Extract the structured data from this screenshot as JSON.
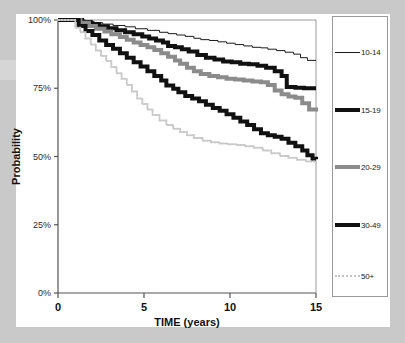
{
  "figure": {
    "background_color": "#c9c9c9",
    "panel_color": "#ffffff"
  },
  "chart_data": {
    "type": "line",
    "title": "",
    "subtitle": "",
    "xlabel": "TIME (years)",
    "ylabel": "Probability",
    "xlim": [
      0,
      15
    ],
    "ylim": [
      0,
      1
    ],
    "xticks": [
      "0",
      "5",
      "10",
      "15"
    ],
    "xtick_values": [
      0,
      5,
      10,
      15
    ],
    "yticks": [
      "0%",
      "25%",
      "50%",
      "75%",
      "100%"
    ],
    "ytick_values": [
      0,
      0.25,
      0.5,
      0.75,
      1.0
    ],
    "grid": false,
    "legend_position": "right",
    "curve_style": "step",
    "series": [
      {
        "name": "10-14",
        "color": "#1a1a1a",
        "width": 1,
        "dash": "none",
        "x": [
          0,
          0.9,
          1.6,
          2.1,
          2.6,
          3.2,
          3.9,
          4.5,
          5.2,
          5.9,
          6.4,
          6.9,
          7.4,
          7.9,
          8.3,
          8.8,
          9.3,
          9.8,
          10.3,
          10.8,
          11.3,
          11.8,
          12.2,
          12.7,
          13.2,
          13.7,
          14.1,
          14.5,
          15
        ],
        "y": [
          1.0,
          1.0,
          0.995,
          0.99,
          0.985,
          0.98,
          0.975,
          0.968,
          0.962,
          0.955,
          0.95,
          0.945,
          0.94,
          0.933,
          0.928,
          0.925,
          0.92,
          0.915,
          0.91,
          0.905,
          0.9,
          0.898,
          0.893,
          0.888,
          0.882,
          0.875,
          0.862,
          0.852,
          0.852
        ]
      },
      {
        "name": "15-19",
        "color": "#111111",
        "width": 4,
        "dash": "none",
        "x": [
          0,
          0.9,
          1.4,
          1.9,
          2.4,
          2.9,
          3.4,
          3.9,
          4.4,
          4.9,
          5.3,
          5.7,
          6.1,
          6.4,
          6.8,
          7.2,
          7.6,
          8.1,
          8.6,
          9.1,
          9.6,
          10.1,
          10.6,
          11.1,
          11.6,
          12.1,
          12.6,
          13.0,
          13.3,
          13.8,
          14.3,
          15
        ],
        "y": [
          1.0,
          1.0,
          0.993,
          0.985,
          0.977,
          0.97,
          0.962,
          0.955,
          0.948,
          0.94,
          0.932,
          0.925,
          0.918,
          0.905,
          0.9,
          0.893,
          0.885,
          0.872,
          0.862,
          0.855,
          0.848,
          0.845,
          0.84,
          0.838,
          0.832,
          0.825,
          0.812,
          0.795,
          0.755,
          0.752,
          0.75,
          0.75
        ]
      },
      {
        "name": "20-29",
        "color": "#8b8b8b",
        "width": 4,
        "dash": "none",
        "x": [
          0,
          0.9,
          1.3,
          1.8,
          2.2,
          2.7,
          3.1,
          3.6,
          4.0,
          4.4,
          4.8,
          5.2,
          5.6,
          6.0,
          6.4,
          6.8,
          7.1,
          7.5,
          7.9,
          8.3,
          8.8,
          9.3,
          9.8,
          10.3,
          10.8,
          11.3,
          11.8,
          12.2,
          12.6,
          13.0,
          13.4,
          13.8,
          14.2,
          14.6,
          15
        ],
        "y": [
          1.0,
          1.0,
          0.99,
          0.978,
          0.968,
          0.958,
          0.948,
          0.938,
          0.928,
          0.918,
          0.908,
          0.9,
          0.89,
          0.878,
          0.865,
          0.852,
          0.84,
          0.825,
          0.812,
          0.802,
          0.795,
          0.79,
          0.785,
          0.782,
          0.778,
          0.775,
          0.772,
          0.762,
          0.742,
          0.728,
          0.72,
          0.715,
          0.695,
          0.672,
          0.665
        ]
      },
      {
        "name": "30-49",
        "color": "#111111",
        "width": 4,
        "dash": "none",
        "x": [
          0,
          0.8,
          1.2,
          1.6,
          2.0,
          2.4,
          2.8,
          3.2,
          3.6,
          4.0,
          4.4,
          4.8,
          5.2,
          5.6,
          6.0,
          6.3,
          6.7,
          7.0,
          7.4,
          7.8,
          8.2,
          8.6,
          9.0,
          9.4,
          9.8,
          10.2,
          10.6,
          11.0,
          11.4,
          11.8,
          12.2,
          12.6,
          13.0,
          13.4,
          13.8,
          14.2,
          14.5,
          14.8,
          15
        ],
        "y": [
          1.0,
          1.0,
          0.978,
          0.96,
          0.945,
          0.925,
          0.908,
          0.895,
          0.878,
          0.862,
          0.845,
          0.83,
          0.812,
          0.795,
          0.778,
          0.76,
          0.748,
          0.735,
          0.722,
          0.712,
          0.702,
          0.69,
          0.678,
          0.668,
          0.655,
          0.642,
          0.628,
          0.615,
          0.6,
          0.585,
          0.578,
          0.572,
          0.565,
          0.55,
          0.538,
          0.522,
          0.505,
          0.492,
          0.49
        ]
      },
      {
        "name": "50+",
        "color": "#c9c9c9",
        "width": 2,
        "dash": "dotted",
        "x": [
          0,
          0.7,
          1.0,
          1.3,
          1.6,
          1.9,
          2.2,
          2.5,
          2.8,
          3.1,
          3.4,
          3.7,
          4.0,
          4.3,
          4.6,
          4.9,
          5.2,
          5.5,
          5.9,
          6.3,
          6.7,
          7.1,
          7.5,
          7.9,
          8.4,
          8.9,
          9.4,
          9.9,
          10.4,
          10.9,
          11.4,
          11.9,
          12.4,
          12.9,
          13.4,
          13.9,
          14.4,
          15
        ],
        "y": [
          1.0,
          1.0,
          0.972,
          0.955,
          0.932,
          0.91,
          0.888,
          0.868,
          0.85,
          0.828,
          0.805,
          0.785,
          0.762,
          0.738,
          0.712,
          0.692,
          0.672,
          0.652,
          0.632,
          0.615,
          0.602,
          0.59,
          0.578,
          0.568,
          0.558,
          0.552,
          0.548,
          0.545,
          0.542,
          0.538,
          0.532,
          0.522,
          0.512,
          0.502,
          0.495,
          0.488,
          0.482,
          0.478
        ]
      }
    ],
    "legend": [
      {
        "label": "10-14",
        "style": "thin-solid-black"
      },
      {
        "label": "15-19",
        "style": "thick-solid-black"
      },
      {
        "label": "20-29",
        "style": "thick-solid-gray"
      },
      {
        "label": "30-49",
        "style": "thick-solid-black"
      },
      {
        "label": "50+",
        "style": "dotted-lightgray"
      }
    ]
  }
}
